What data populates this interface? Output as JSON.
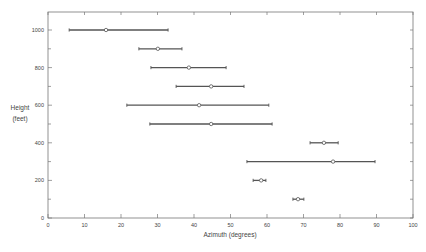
{
  "chart_data": {
    "type": "errorbar",
    "title": "",
    "xlabel": "Azimuth (degrees)",
    "ylabel": [
      "Height",
      "(feet)"
    ],
    "xlim": [
      0,
      100
    ],
    "ylim": [
      0,
      1100
    ],
    "x_ticks": [
      0,
      10,
      20,
      30,
      40,
      50,
      60,
      70,
      80,
      90,
      100
    ],
    "y_ticks_labeled": [
      0,
      200,
      400,
      600,
      800,
      1000
    ],
    "y_ticks_minor": [
      100,
      300,
      500,
      700,
      900
    ],
    "grid": false,
    "legend": null,
    "series": [
      {
        "height": 1000,
        "center": 15.9,
        "low": 5.8,
        "high": 32.9
      },
      {
        "height": 900,
        "center": 30.1,
        "low": 24.9,
        "high": 36.7
      },
      {
        "height": 800,
        "center": 38.6,
        "low": 28.2,
        "high": 48.8
      },
      {
        "height": 700,
        "center": 44.7,
        "low": 35.1,
        "high": 53.7
      },
      {
        "height": 600,
        "center": 41.4,
        "low": 21.6,
        "high": 60.5
      },
      {
        "height": 500,
        "center": 44.7,
        "low": 27.9,
        "high": 61.4
      },
      {
        "height": 400,
        "center": 75.6,
        "low": 71.8,
        "high": 79.5
      },
      {
        "height": 300,
        "center": 78.1,
        "low": 54.5,
        "high": 89.6
      },
      {
        "height": 200,
        "center": 58.4,
        "low": 56.2,
        "high": 59.7
      },
      {
        "height": 100,
        "center": 68.5,
        "low": 67.1,
        "high": 70.1
      }
    ]
  },
  "colors": {
    "line": "#555555",
    "frame": "#777777",
    "marker_fill": "#ffffff"
  }
}
